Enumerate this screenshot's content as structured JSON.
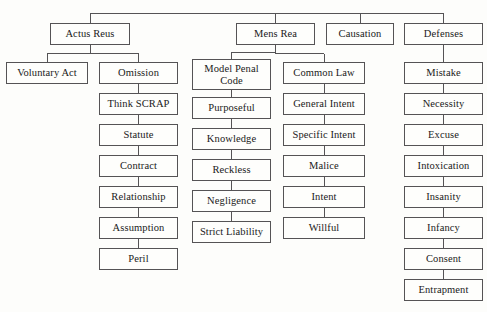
{
  "diagram": {
    "type": "hierarchy-tree",
    "orientation": "top-down",
    "background_color": "#fdfdfb",
    "box_border_color": "#555355",
    "box_fill_color": "#fefefc",
    "text_color": "#1a1a1a",
    "root_hidden": true,
    "columns": [
      {
        "id": "actus-reus",
        "label": "Actus Reus",
        "children": [
          "Voluntary Act",
          "Omission"
        ]
      },
      {
        "id": "mens-rea",
        "label": "Mens Rea",
        "children": [
          "Model Penal Code",
          "Common Law"
        ]
      },
      {
        "id": "causation",
        "label": "Causation",
        "children": []
      },
      {
        "id": "defenses",
        "label": "Defenses",
        "children": [
          "Mistake"
        ]
      }
    ],
    "nodes": [
      {
        "id": "actus-reus",
        "text": "Actus Reus",
        "x": 50,
        "y": 23,
        "w": 80,
        "h": 22
      },
      {
        "id": "mens-rea",
        "text": "Mens Rea",
        "x": 236,
        "y": 23,
        "w": 79,
        "h": 22
      },
      {
        "id": "causation",
        "text": "Causation",
        "x": 326,
        "y": 23,
        "w": 68,
        "h": 22
      },
      {
        "id": "defenses",
        "text": "Defenses",
        "x": 404,
        "y": 23,
        "w": 79,
        "h": 22
      },
      {
        "id": "voluntary-act",
        "text": "Voluntary Act",
        "x": 6,
        "y": 62,
        "w": 82,
        "h": 22
      },
      {
        "id": "omission",
        "text": "Omission",
        "x": 99,
        "y": 62,
        "w": 79,
        "h": 22
      },
      {
        "id": "think-scrap",
        "text": "Think SCRAP",
        "x": 99,
        "y": 93,
        "w": 79,
        "h": 22
      },
      {
        "id": "statute",
        "text": "Statute",
        "x": 99,
        "y": 124,
        "w": 79,
        "h": 22
      },
      {
        "id": "contract",
        "text": "Contract",
        "x": 99,
        "y": 155,
        "w": 79,
        "h": 22
      },
      {
        "id": "relationship",
        "text": "Relationship",
        "x": 99,
        "y": 186,
        "w": 79,
        "h": 22
      },
      {
        "id": "assumption",
        "text": "Assumption",
        "x": 99,
        "y": 217,
        "w": 79,
        "h": 22
      },
      {
        "id": "peril",
        "text": "Peril",
        "x": 99,
        "y": 248,
        "w": 79,
        "h": 22
      },
      {
        "id": "model-penal-code",
        "text": "Model Penal\nCode",
        "x": 192,
        "y": 59,
        "w": 79,
        "h": 31,
        "two_line": true
      },
      {
        "id": "purposeful",
        "text": "Purposeful",
        "x": 192,
        "y": 97,
        "w": 79,
        "h": 22
      },
      {
        "id": "knowledge",
        "text": "Knowledge",
        "x": 192,
        "y": 128,
        "w": 79,
        "h": 22
      },
      {
        "id": "reckless",
        "text": "Reckless",
        "x": 192,
        "y": 159,
        "w": 79,
        "h": 22
      },
      {
        "id": "negligence",
        "text": "Negligence",
        "x": 192,
        "y": 190,
        "w": 79,
        "h": 22
      },
      {
        "id": "strict-liability",
        "text": "Strict Liability",
        "x": 192,
        "y": 221,
        "w": 79,
        "h": 22
      },
      {
        "id": "common-law",
        "text": "Common Law",
        "x": 283,
        "y": 62,
        "w": 82,
        "h": 22
      },
      {
        "id": "general-intent",
        "text": "General Intent",
        "x": 283,
        "y": 93,
        "w": 82,
        "h": 22
      },
      {
        "id": "specific-intent",
        "text": "Specific Intent",
        "x": 283,
        "y": 124,
        "w": 82,
        "h": 22
      },
      {
        "id": "malice",
        "text": "Malice",
        "x": 283,
        "y": 155,
        "w": 82,
        "h": 22
      },
      {
        "id": "intent",
        "text": "Intent",
        "x": 283,
        "y": 186,
        "w": 82,
        "h": 22
      },
      {
        "id": "willful",
        "text": "Willful",
        "x": 283,
        "y": 217,
        "w": 82,
        "h": 22
      },
      {
        "id": "mistake",
        "text": "Mistake",
        "x": 404,
        "y": 62,
        "w": 79,
        "h": 22
      },
      {
        "id": "necessity",
        "text": "Necessity",
        "x": 404,
        "y": 93,
        "w": 79,
        "h": 22
      },
      {
        "id": "excuse",
        "text": "Excuse",
        "x": 404,
        "y": 124,
        "w": 79,
        "h": 22
      },
      {
        "id": "intoxication",
        "text": "Intoxication",
        "x": 404,
        "y": 155,
        "w": 79,
        "h": 22
      },
      {
        "id": "insanity",
        "text": "Insanity",
        "x": 404,
        "y": 186,
        "w": 79,
        "h": 22
      },
      {
        "id": "infancy",
        "text": "Infancy",
        "x": 404,
        "y": 217,
        "w": 79,
        "h": 22
      },
      {
        "id": "consent",
        "text": "Consent",
        "x": 404,
        "y": 248,
        "w": 79,
        "h": 22
      },
      {
        "id": "entrapment",
        "text": "Entrapment",
        "x": 404,
        "y": 279,
        "w": 79,
        "h": 22
      }
    ],
    "edges": [
      {
        "from": "root-bus",
        "to": "actus-reus"
      },
      {
        "from": "root-bus",
        "to": "mens-rea"
      },
      {
        "from": "root-bus",
        "to": "causation"
      },
      {
        "from": "root-bus",
        "to": "defenses"
      },
      {
        "from": "actus-reus",
        "to": "voluntary-act"
      },
      {
        "from": "actus-reus",
        "to": "omission"
      },
      {
        "from": "omission",
        "to": "think-scrap"
      },
      {
        "from": "think-scrap",
        "to": "statute"
      },
      {
        "from": "statute",
        "to": "contract"
      },
      {
        "from": "contract",
        "to": "relationship"
      },
      {
        "from": "relationship",
        "to": "assumption"
      },
      {
        "from": "assumption",
        "to": "peril"
      },
      {
        "from": "mens-rea",
        "to": "model-penal-code"
      },
      {
        "from": "mens-rea",
        "to": "common-law"
      },
      {
        "from": "model-penal-code",
        "to": "purposeful"
      },
      {
        "from": "purposeful",
        "to": "knowledge"
      },
      {
        "from": "knowledge",
        "to": "reckless"
      },
      {
        "from": "reckless",
        "to": "negligence"
      },
      {
        "from": "negligence",
        "to": "strict-liability"
      },
      {
        "from": "common-law",
        "to": "general-intent"
      },
      {
        "from": "general-intent",
        "to": "specific-intent"
      },
      {
        "from": "specific-intent",
        "to": "malice"
      },
      {
        "from": "malice",
        "to": "intent"
      },
      {
        "from": "intent",
        "to": "willful"
      },
      {
        "from": "defenses",
        "to": "mistake"
      },
      {
        "from": "mistake",
        "to": "necessity"
      },
      {
        "from": "necessity",
        "to": "excuse"
      },
      {
        "from": "excuse",
        "to": "intoxication"
      },
      {
        "from": "intoxication",
        "to": "insanity"
      },
      {
        "from": "insanity",
        "to": "infancy"
      },
      {
        "from": "infancy",
        "to": "consent"
      },
      {
        "from": "consent",
        "to": "entrapment"
      }
    ],
    "trunk": {
      "y": 13,
      "x_start": 90,
      "x_end": 443
    }
  }
}
